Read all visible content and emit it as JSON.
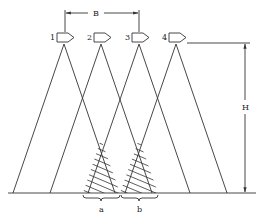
{
  "diagram": {
    "type": "camera-coverage-overlap",
    "cameras": [
      {
        "label": "1"
      },
      {
        "label": "2"
      },
      {
        "label": "3"
      },
      {
        "label": "4"
      }
    ],
    "dimensions": {
      "baseline_label": "B",
      "height_label": "H"
    },
    "overlap_regions": [
      {
        "label": "a"
      },
      {
        "label": "b"
      }
    ],
    "colors": {
      "line": "#333333",
      "background": "#ffffff"
    }
  }
}
